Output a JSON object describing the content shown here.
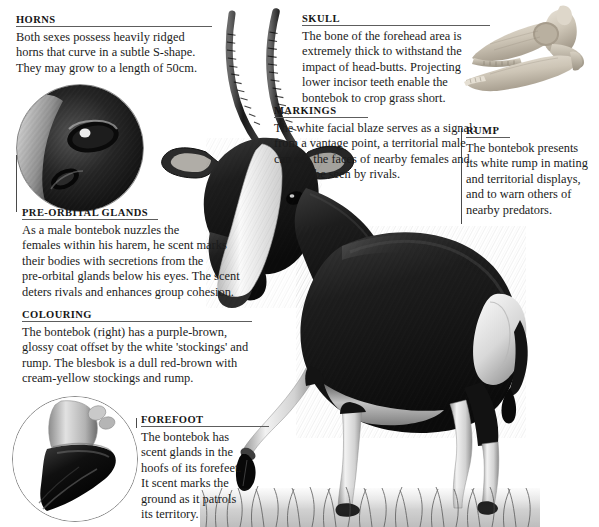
{
  "document": {
    "subject": "Bontebok anatomy annotated illustration",
    "background_color": "#ffffff",
    "text_color": "#1b1b1b",
    "rule_color": "#5d5d5d"
  },
  "callouts": [
    {
      "id": "horns",
      "heading": "Horns",
      "lines": [
        "Both sexes possess heavily ridged",
        "horns that curve in a subtle S-shape.",
        "They may grow to a length of 50cm."
      ]
    },
    {
      "id": "skull",
      "heading": "Skull",
      "lines": [
        "The bone of the forehead area is",
        "extremely thick to withstand the",
        "impact of head-butts. Projecting",
        "lower incisor teeth enable the",
        "bontebok to crop grass short."
      ]
    },
    {
      "id": "markings",
      "heading": "Markings",
      "lines": [
        "The white facial blaze serves as a signal:",
        "from a vantage point, a territorial male",
        "can see the faces of nearby females and",
        "        be seen by rivals."
      ]
    },
    {
      "id": "rump",
      "heading": "Rump",
      "lines": [
        "The bontebok presents",
        "its white rump in mating",
        "and territorial displays,",
        "and to warn others of",
        "nearby predators."
      ]
    },
    {
      "id": "pre-orbital-glands",
      "heading": "Pre-orbital glands",
      "lines": [
        "As a male bontebok nuzzles the",
        "females within his harem, he scent marks",
        "their bodies with secretions from the",
        "pre-orbital glands below his eyes. The scent",
        "deters rivals and enhances group cohesion."
      ]
    },
    {
      "id": "colouring",
      "heading": "Colouring",
      "lines": [
        "The bontebok (right) has a purple-brown,",
        "glossy coat offset by the white 'stockings' and",
        "rump. The blesbok is a dull red-brown with",
        "cream-yellow stockings and rump."
      ]
    },
    {
      "id": "forefoot",
      "heading": "Forefoot",
      "lines": [
        "The bontebok has",
        "scent glands in the",
        "hoofs of its forefeet.",
        "It scent marks the",
        "ground as it patrols",
        "its territory."
      ]
    }
  ],
  "figures": [
    {
      "id": "eye-detail-circle",
      "label": "pre-orbital gland eye close-up"
    },
    {
      "id": "hoof-detail-circle",
      "label": "forefoot hoof close-up"
    },
    {
      "id": "skull-figure",
      "label": "bontebok skull in profile"
    },
    {
      "id": "bontebok-figure",
      "label": "standing bontebok antelope"
    }
  ]
}
